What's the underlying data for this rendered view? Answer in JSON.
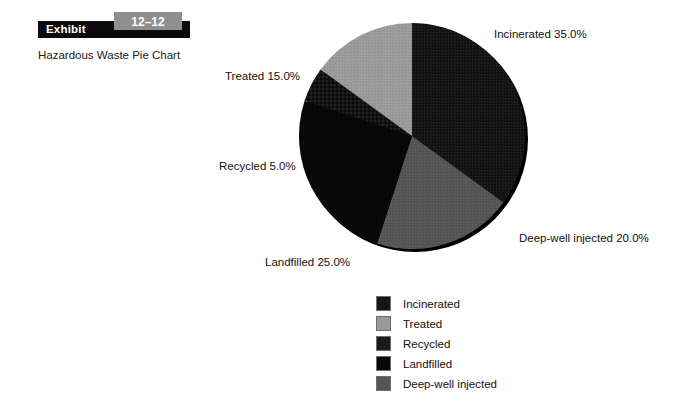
{
  "exhibit": {
    "label": "Exhibit",
    "number": "12–12",
    "subtitle": "Hazardous Waste Pie Chart"
  },
  "chart_data": {
    "type": "pie",
    "title": "Hazardous Waste Pie Chart",
    "legend_position": "bottom",
    "grid": false,
    "categories": [
      "Incinerated",
      "Treated",
      "Recycled",
      "Landfilled",
      "Deep-well injected"
    ],
    "values": [
      35.0,
      15.0,
      5.0,
      25.0,
      20.0
    ],
    "units": "%",
    "annotations": [
      "Incinerated 35.0%",
      "Treated 15.0%",
      "Recycled 5.0%",
      "Landfilled 25.0%",
      "Deep-well injected 20.0%"
    ],
    "slices": [
      {
        "name": "Incinerated",
        "value": 35.0,
        "label": "Incinerated 35.0%",
        "color": "#151515",
        "start_deg": 0,
        "end_deg": 126
      },
      {
        "name": "Deep-well injected",
        "value": 20.0,
        "label": "Deep-well injected 20.0%",
        "color": "#565656",
        "start_deg": 126,
        "end_deg": 198
      },
      {
        "name": "Landfilled",
        "value": 25.0,
        "label": "Landfilled 25.0%",
        "color": "#070707",
        "start_deg": 198,
        "end_deg": 288
      },
      {
        "name": "Recycled",
        "value": 5.0,
        "label": "Recycled 5.0%",
        "color": "#1b1b1b",
        "start_deg": 288,
        "end_deg": 306
      },
      {
        "name": "Treated",
        "value": 15.0,
        "label": "Treated 15.0%",
        "color": "#9a9a9a",
        "start_deg": 306,
        "end_deg": 360
      }
    ]
  },
  "legend": {
    "items": [
      {
        "label": "Incinerated",
        "color": "#151515"
      },
      {
        "label": "Treated",
        "color": "#9a9a9a"
      },
      {
        "label": "Recycled",
        "color": "#1b1b1b"
      },
      {
        "label": "Landfilled",
        "color": "#070707"
      },
      {
        "label": "Deep-well injected",
        "color": "#565656"
      }
    ]
  },
  "colors": {
    "background": "#ffffff",
    "exhibit_bar": "#0b0b0b",
    "exhibit_tab": "#8f8f8f",
    "text": "#111111"
  }
}
